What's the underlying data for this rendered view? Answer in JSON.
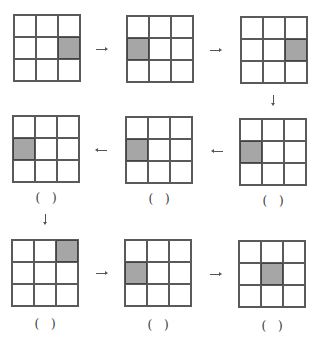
{
  "diagram": {
    "colors": {
      "shaded": "#a6a6a6",
      "line": "#5a5a5a",
      "background": "#ffffff"
    },
    "grids": [
      {
        "id": 1,
        "shaded": [
          1,
          2
        ],
        "blank": false
      },
      {
        "id": 2,
        "shaded": [
          1,
          0
        ],
        "blank": false
      },
      {
        "id": 3,
        "shaded": [
          1,
          2
        ],
        "blank": false
      },
      {
        "id": 4,
        "shaded": [
          1,
          0
        ],
        "blank": true
      },
      {
        "id": 5,
        "shaded": [
          1,
          0
        ],
        "blank": true
      },
      {
        "id": 6,
        "shaded": [
          1,
          0
        ],
        "blank": true
      },
      {
        "id": 7,
        "shaded": [
          0,
          2
        ],
        "blank": true
      },
      {
        "id": 8,
        "shaded": [
          1,
          0
        ],
        "blank": true
      },
      {
        "id": 9,
        "shaded": [
          1,
          1
        ],
        "blank": true
      }
    ],
    "arrows": [
      {
        "from": 1,
        "to": 2,
        "direction": "right"
      },
      {
        "from": 2,
        "to": 3,
        "direction": "right"
      },
      {
        "from": 3,
        "to": 6,
        "direction": "down"
      },
      {
        "from": 6,
        "to": 5,
        "direction": "left"
      },
      {
        "from": 5,
        "to": 4,
        "direction": "left"
      },
      {
        "from": 4,
        "to": 7,
        "direction": "down"
      },
      {
        "from": 7,
        "to": 8,
        "direction": "right"
      },
      {
        "from": 8,
        "to": 9,
        "direction": "right"
      }
    ],
    "blank_label": "(  )"
  }
}
